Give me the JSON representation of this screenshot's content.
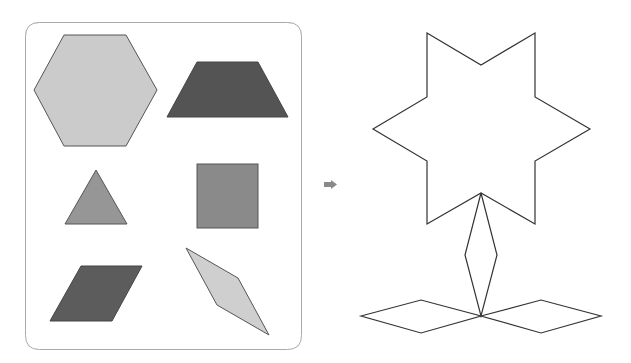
{
  "colors": {
    "hexagon": "#cbcbcb",
    "trapezoid": "#545454",
    "triangle": "#969696",
    "square": "#8a8a8a",
    "parallelogram": "#5c5c5c",
    "rhombus": "#cfcfcf",
    "outline": "#333333",
    "frame": "#aaaaaa",
    "arrow": "#8a8a8a"
  },
  "shapes_panel": {
    "items": [
      "hexagon",
      "trapezoid",
      "triangle",
      "square",
      "parallelogram",
      "thin-rhombus"
    ]
  },
  "arrow": {
    "direction": "right"
  },
  "composite_figure": {
    "parts": [
      "six-pointed-star",
      "stem-rhombus",
      "left-leaf-rhombus",
      "right-leaf-rhombus"
    ]
  }
}
